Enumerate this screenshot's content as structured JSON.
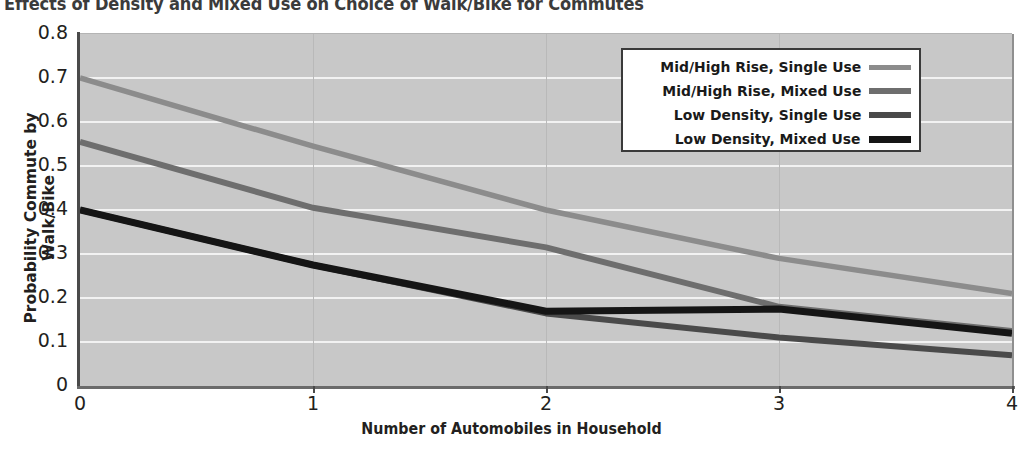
{
  "chart_data": {
    "type": "line",
    "title": "Effects of Density and Mixed Use on Choice of Walk/Bike for Commutes",
    "xlabel": "Number of Automobiles in Household",
    "ylabel": "Probability Commute by Walk/Bike",
    "x": [
      0,
      1,
      2,
      3,
      4
    ],
    "xlim": [
      0,
      4
    ],
    "ylim": [
      0,
      0.8
    ],
    "xticks": [
      "0",
      "1",
      "2",
      "3",
      "4"
    ],
    "yticks": [
      "0",
      "0.1",
      "0.2",
      "0.3",
      "0.4",
      "0.5",
      "0.6",
      "0.7",
      "0.8"
    ],
    "grid": "horizontal",
    "legend_position": "top-right",
    "plot_background": "#c8c8c8",
    "series": [
      {
        "name": "Mid/High Rise, Single Use",
        "color": "#8c8c8c",
        "values": [
          0.7,
          0.545,
          0.4,
          0.29,
          0.21
        ]
      },
      {
        "name": "Mid/High Rise, Mixed Use",
        "color": "#6e6e6e",
        "values": [
          0.555,
          0.405,
          0.315,
          0.18,
          0.125
        ]
      },
      {
        "name": "Low Density, Single Use",
        "color": "#4a4a4a",
        "values": [
          0.4,
          0.275,
          0.165,
          0.11,
          0.07
        ]
      },
      {
        "name": "Low Density, Mixed Use",
        "color": "#151515",
        "values": [
          0.4,
          0.275,
          0.17,
          0.175,
          0.12
        ]
      }
    ]
  },
  "axes": {
    "y_ticks": [
      "0.8",
      "0.7",
      "0.6",
      "0.5",
      "0.4",
      "0.3",
      "0.2",
      "0.1",
      "0"
    ],
    "x_ticks": [
      "0",
      "1",
      "2",
      "3",
      "4"
    ],
    "x_title": "Number of Automobiles in Household",
    "y_title": "Probability Commute by Walk/Bike"
  },
  "legend": {
    "items": [
      {
        "label": "Mid/High Rise, Single Use",
        "color": "#8c8c8c",
        "thickness": "5px"
      },
      {
        "label": "Mid/High Rise, Mixed Use",
        "color": "#6e6e6e",
        "thickness": "6px"
      },
      {
        "label": "Low Density, Single Use",
        "color": "#4a4a4a",
        "thickness": "6px"
      },
      {
        "label": "Low Density, Mixed Use",
        "color": "#151515",
        "thickness": "7px"
      }
    ]
  },
  "title": "Effects of Density and Mixed Use on Choice of Walk/Bike for Commutes"
}
